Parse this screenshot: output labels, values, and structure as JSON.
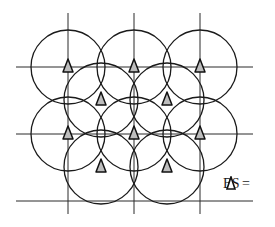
{
  "diagram": {
    "title": "",
    "colors": {
      "line": "#1a1a1a",
      "grid": "#2a2a2a",
      "triangle_fill": "#bdbdbd",
      "triangle_stroke": "#111111",
      "background": "#ffffff"
    },
    "grid": {
      "vertical_x": [
        68,
        134,
        200
      ],
      "horizontal_y": [
        67,
        134,
        201
      ],
      "v_extent": [
        13,
        214
      ],
      "h_extent": [
        16,
        253
      ]
    },
    "circle_radius": 37,
    "cells_primary": [
      {
        "cx": 68,
        "cy": 67
      },
      {
        "cx": 134,
        "cy": 67
      },
      {
        "cx": 200,
        "cy": 67
      },
      {
        "cx": 68,
        "cy": 134
      },
      {
        "cx": 134,
        "cy": 134
      },
      {
        "cx": 200,
        "cy": 134
      }
    ],
    "cells_offset": [
      {
        "cx": 101,
        "cy": 100
      },
      {
        "cx": 167,
        "cy": 100
      },
      {
        "cx": 101,
        "cy": 167
      },
      {
        "cx": 167,
        "cy": 167
      }
    ],
    "base_stations": [
      {
        "x": 68,
        "y": 67
      },
      {
        "x": 134,
        "y": 67
      },
      {
        "x": 200,
        "y": 67
      },
      {
        "x": 101,
        "y": 100
      },
      {
        "x": 167,
        "y": 100
      },
      {
        "x": 68,
        "y": 134
      },
      {
        "x": 134,
        "y": 134
      },
      {
        "x": 200,
        "y": 134
      },
      {
        "x": 101,
        "y": 167
      },
      {
        "x": 167,
        "y": 167
      }
    ],
    "legend": {
      "label": "BS =",
      "symbol": "triangle-icon"
    }
  }
}
